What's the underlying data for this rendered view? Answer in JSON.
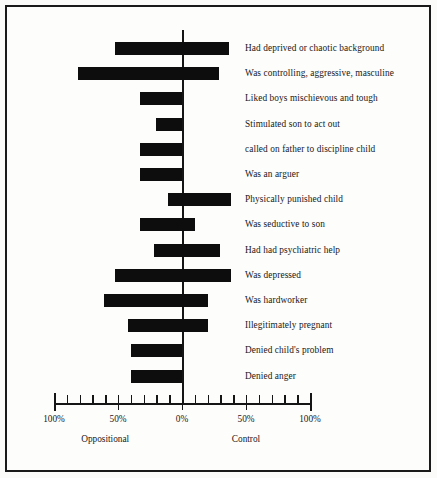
{
  "chart_data": {
    "type": "bar",
    "orientation": "horizontal",
    "subtype": "diverging-bidirectional",
    "title": "",
    "xlabel": "",
    "ylabel": "",
    "xlim": [
      -100,
      100
    ],
    "grid": false,
    "legend": null,
    "axis_tick_labels": [
      "100%",
      "50%",
      "0%",
      "50%",
      "100%"
    ],
    "axis_tick_values": [
      -100,
      -50,
      0,
      50,
      100
    ],
    "minor_tick_step": 10,
    "left_direction_label": "Oppositional",
    "right_direction_label": "Control",
    "bar_color": "#0d0d0d",
    "categories": [
      "Had deprived or chaotic background",
      "Was controlling, aggressive, masculine",
      "Liked boys mischievous and tough",
      "Stimulated son to act out",
      "called on father to discipline child",
      "Was an arguer",
      "Physically punished child",
      "Was seductive to son",
      "Had had psychiatric help",
      "Was depressed",
      "Was hardworker",
      "Illegitimately pregnant",
      "Denied child's problem",
      "Denied anger"
    ],
    "series": [
      {
        "name": "Oppositional",
        "direction": "left",
        "values": [
          52,
          81,
          33,
          20,
          33,
          33,
          11,
          33,
          22,
          52,
          61,
          42,
          40,
          40
        ]
      },
      {
        "name": "Control",
        "direction": "right",
        "values": [
          37,
          29,
          0,
          0,
          0,
          0,
          38,
          10,
          30,
          38,
          20,
          20,
          0,
          0
        ]
      }
    ],
    "rows": [
      {
        "label": "Had deprived or chaotic background",
        "oppositional": 52,
        "control": 37
      },
      {
        "label": "Was controlling, aggressive, masculine",
        "oppositional": 81,
        "control": 29
      },
      {
        "label": "Liked boys mischievous and tough",
        "oppositional": 33,
        "control": 0
      },
      {
        "label": "Stimulated son to act out",
        "oppositional": 20,
        "control": 0
      },
      {
        "label": "called on father to discipline child",
        "oppositional": 33,
        "control": 0
      },
      {
        "label": "Was an arguer",
        "oppositional": 33,
        "control": 0
      },
      {
        "label": "Physically punished child",
        "oppositional": 11,
        "control": 38
      },
      {
        "label": "Was seductive to son",
        "oppositional": 33,
        "control": 10
      },
      {
        "label": "Had had psychiatric help",
        "oppositional": 22,
        "control": 30
      },
      {
        "label": "Was depressed",
        "oppositional": 52,
        "control": 38
      },
      {
        "label": "Was hardworker",
        "oppositional": 61,
        "control": 20
      },
      {
        "label": "Illegitimately pregnant",
        "oppositional": 42,
        "control": 20
      },
      {
        "label": "Denied child's problem",
        "oppositional": 40,
        "control": 0
      },
      {
        "label": "Denied anger",
        "oppositional": 40,
        "control": 0
      }
    ]
  },
  "layout": {
    "zero_x": 182,
    "px_per_percent": 1.28,
    "first_row_y": 42,
    "row_step": 25.2,
    "bar_height": 13,
    "axis_y": 403
  }
}
